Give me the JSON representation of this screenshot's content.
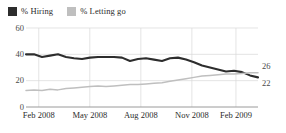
{
  "legend": {
    "position": "top-left",
    "entries": [
      {
        "label": "% Hiring",
        "color": "#2d2d2d",
        "icon": "square-swatch"
      },
      {
        "label": "% Letting go",
        "color": "#bfbfbf",
        "icon": "square-swatch"
      }
    ]
  },
  "end_labels": {
    "letting_go": "26",
    "hiring": "22"
  },
  "chart_data": {
    "type": "line",
    "title": "",
    "subtitle": "",
    "xlabel": "",
    "ylabel": "",
    "ylim": [
      0,
      60
    ],
    "yticks": [
      "0",
      "20",
      "40",
      "60"
    ],
    "ytick_values": [
      0,
      20,
      40,
      60
    ],
    "grid": "both",
    "legend_position": "top-left",
    "xticks": [
      "Feb 2008",
      "May 2008",
      "Aug 2008",
      "Nov 2008",
      "Feb 2009"
    ],
    "xtick_positions": [
      0.055,
      0.275,
      0.495,
      0.715,
      0.905
    ],
    "x": [
      "Jan 2008",
      "Feb 2008",
      "Feb 2008",
      "Mar 2008",
      "Mar 2008",
      "Apr 2008",
      "Apr 2008",
      "May 2008",
      "May 2008",
      "Jun 2008",
      "Jun 2008",
      "Jul 2008",
      "Jul 2008",
      "Aug 2008",
      "Aug 2008",
      "Sep 2008",
      "Sep 2008",
      "Oct 2008",
      "Oct 2008",
      "Nov 2008",
      "Nov 2008",
      "Dec 2008",
      "Dec 2008",
      "Jan 2009",
      "Jan 2009",
      "Feb 2009",
      "Feb 2009",
      "Mar 2009",
      "Mar 2009",
      "Apr 2009"
    ],
    "series": [
      {
        "name": "% Hiring",
        "color": "#2d2d2d",
        "end_value": 22,
        "values": [
          40,
          40,
          38,
          39,
          40,
          38,
          37,
          36.5,
          37.5,
          38,
          38,
          38,
          37.5,
          35,
          36.5,
          37,
          36,
          35,
          37,
          37.5,
          36,
          34,
          31.5,
          30,
          28.5,
          27,
          27.5,
          26.5,
          24,
          22.5
        ]
      },
      {
        "name": "% Letting go",
        "color": "#bfbfbf",
        "end_value": 26,
        "values": [
          12.5,
          13,
          12.5,
          13.5,
          13,
          14,
          14.5,
          15,
          15.5,
          16,
          15.5,
          16,
          16.5,
          17,
          17,
          17.5,
          18,
          18.5,
          19.5,
          20.5,
          21.5,
          22.5,
          23.5,
          24,
          24.5,
          25,
          25,
          25.5,
          26,
          26
        ]
      }
    ]
  }
}
